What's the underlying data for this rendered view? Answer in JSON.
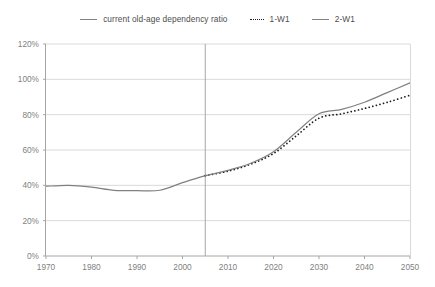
{
  "legend": {
    "position": "top-center",
    "entries": [
      {
        "label": "current old-age dependency ratio",
        "style": "solid",
        "color": "#808080"
      },
      {
        "label": "1-W1",
        "style": "dotted",
        "color": "#1a1a1a"
      },
      {
        "label": "2-W1",
        "style": "solid",
        "color": "#808080"
      }
    ]
  },
  "chart_data": {
    "type": "line",
    "title": "",
    "subtitle": "",
    "xlabel": "",
    "ylabel": "",
    "xlim": [
      1970,
      2050
    ],
    "ylim": [
      0,
      120
    ],
    "grid": true,
    "grid_axis": "y",
    "xticks": [
      1970,
      1980,
      1990,
      2000,
      2010,
      2020,
      2030,
      2040,
      2050
    ],
    "xtick_labels": [
      "1970",
      "1980",
      "1990",
      "2000",
      "2010",
      "2020",
      "2030",
      "2040",
      "2050"
    ],
    "yticks": [
      0,
      20,
      40,
      60,
      80,
      100,
      120
    ],
    "ytick_labels": [
      "0%",
      "20%",
      "40%",
      "60%",
      "80%",
      "100%",
      "120%"
    ],
    "annotations": [
      {
        "type": "vline",
        "x": 2005,
        "label": "",
        "color": "#a6a6a6"
      }
    ],
    "series": [
      {
        "name": "current old-age dependency ratio",
        "style": "solid",
        "color": "#808080",
        "x": [
          1970,
          1975,
          1980,
          1985,
          1990,
          1995,
          2000,
          2005
        ],
        "values": [
          39.5,
          40.0,
          39.0,
          37.2,
          37.0,
          37.2,
          41.5,
          45.5
        ]
      },
      {
        "name": "1-W1",
        "style": "dotted",
        "color": "#1a1a1a",
        "x": [
          2005,
          2010,
          2015,
          2020,
          2025,
          2030,
          2035,
          2040,
          2045,
          2050
        ],
        "values": [
          45.5,
          48.0,
          52.0,
          58.0,
          68.0,
          78.0,
          80.5,
          83.5,
          87.0,
          91.0
        ]
      },
      {
        "name": "2-W1",
        "style": "solid",
        "color": "#808080",
        "x": [
          2005,
          2010,
          2015,
          2020,
          2025,
          2030,
          2035,
          2040,
          2045,
          2050
        ],
        "values": [
          45.5,
          48.5,
          52.5,
          59.0,
          70.0,
          80.5,
          83.0,
          87.0,
          92.5,
          98.0
        ]
      }
    ]
  }
}
